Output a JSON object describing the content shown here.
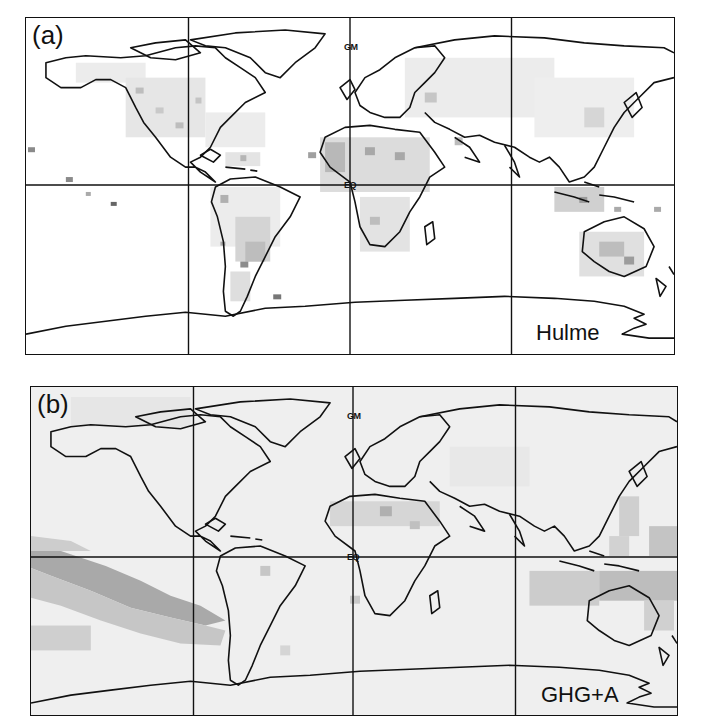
{
  "figure": {
    "panels": [
      {
        "id": "a",
        "label": "(a)",
        "source": "Hulme",
        "background": "#ffffff",
        "gm_label": "GM",
        "eq_label": "EQ"
      },
      {
        "id": "b",
        "label": "(b)",
        "source": "GHG+A",
        "background": "#ececec",
        "gm_label": "GM",
        "eq_label": "EQ"
      }
    ],
    "grid": {
      "meridians_deg": [
        -120,
        0,
        120
      ],
      "parallels_deg": [
        0
      ]
    },
    "shading_colors": {
      "light": "#e2e2e2",
      "medium": "#c4c4c4",
      "dark": "#9a9a9a",
      "darkest": "#7a7a7a"
    }
  }
}
